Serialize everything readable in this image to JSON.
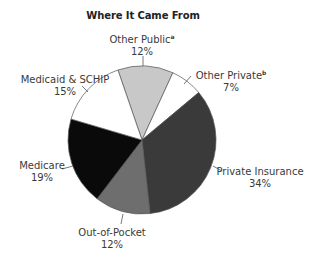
{
  "chart_data": {
    "type": "pie",
    "title": "Where It Came From",
    "start_angle_deg": -19,
    "direction": "clockwise",
    "categories": [
      "Other Public",
      "Other Private",
      "Private Insurance",
      "Out-of-Pocket",
      "Medicare",
      "Medicaid & SCHIP"
    ],
    "values": [
      12,
      7,
      34,
      12,
      19,
      15
    ],
    "value_labels": [
      "12%",
      "7%",
      "34%",
      "12%",
      "19%",
      "15%"
    ],
    "footnote_marks": {
      "Other Public": "a",
      "Other Private": "b"
    },
    "colors": [
      "#c8c8c8",
      "#ffffff",
      "#3a3a3a",
      "#6e6e6e",
      "#0a0a0a",
      "#ffffff"
    ],
    "legend": "none (direct labels with leader lines)",
    "unit": "percent"
  },
  "title": "Where It Came From",
  "labels": {
    "other_public": {
      "name": "Other Public",
      "mark": "a",
      "pct": "12%"
    },
    "other_private": {
      "name": "Other Private",
      "mark": "b",
      "pct": "7%"
    },
    "private_insurance": {
      "name": "Private Insurance",
      "pct": "34%"
    },
    "out_of_pocket": {
      "name": "Out-of-Pocket",
      "pct": "12%"
    },
    "medicare": {
      "name": "Medicare",
      "pct": "19%"
    },
    "medicaid_schip": {
      "name": "Medicaid & SCHIP",
      "pct": "15%"
    }
  },
  "geometry": {
    "cx": 142,
    "cy": 140,
    "r": 74,
    "stroke": "#555555"
  }
}
